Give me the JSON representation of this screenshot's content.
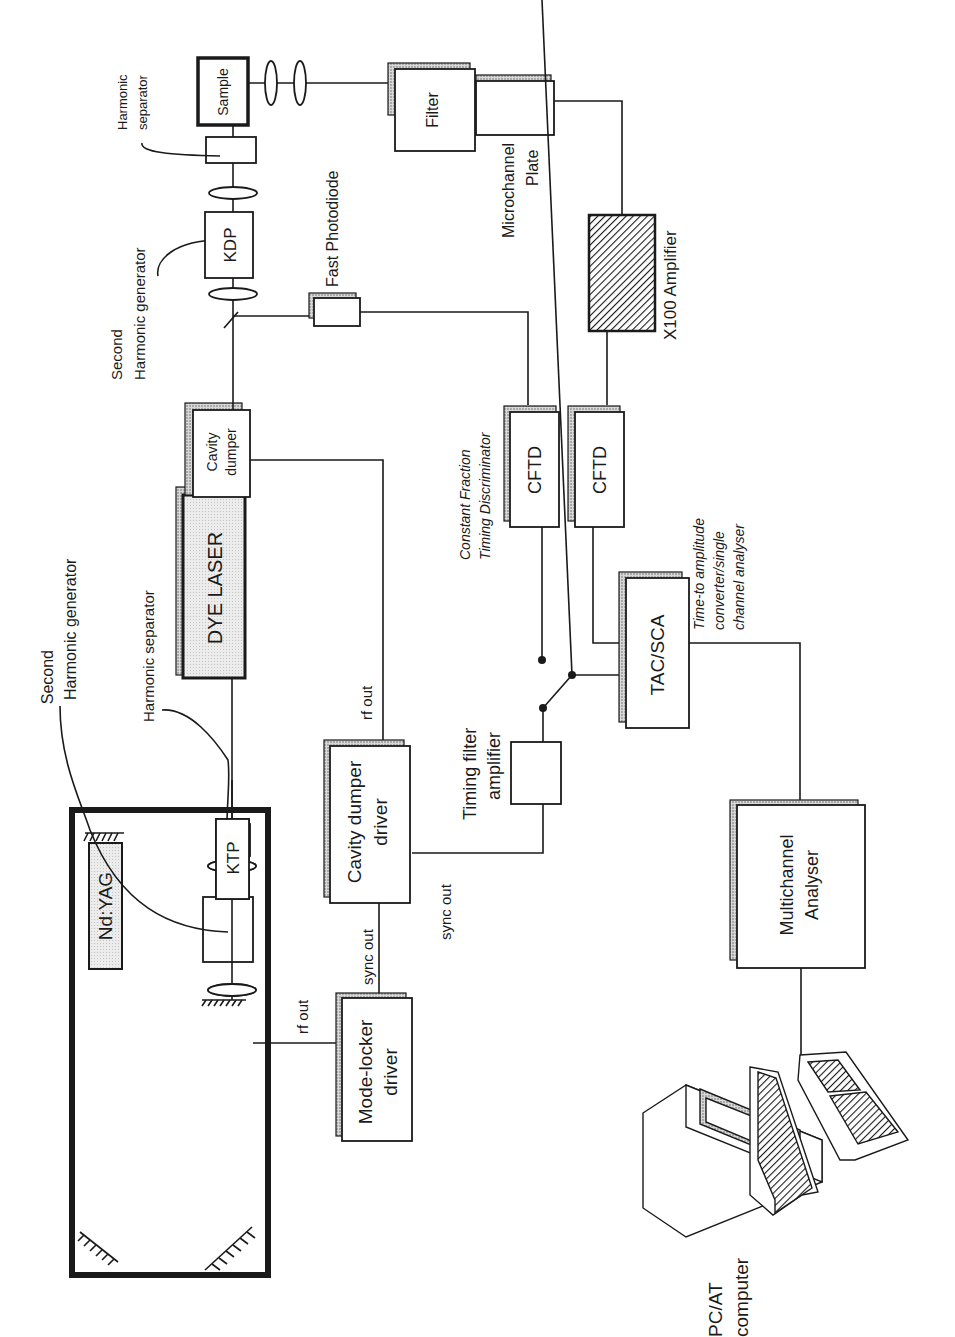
{
  "diagram": {
    "nd_yag": {
      "label": "Nd:YAG",
      "ktp_label": "KTP",
      "shg_label_line1": "Second",
      "shg_label_line2": "Harmonic generator",
      "separator_label": "Harmonic separator"
    },
    "dye_laser": {
      "label": "DYE LASER"
    },
    "cavity_dumper": {
      "line1": "Cavity",
      "line2": "dumper"
    },
    "second_shg": {
      "line1": "Second",
      "line2": "Harmonic generator",
      "crystal": "KDP"
    },
    "harmonic_separator_2": {
      "line1": "Harmonic",
      "line2": "separator"
    },
    "sample": {
      "label": "Sample"
    },
    "filter": {
      "label": "Filter"
    },
    "microchannel_plate": {
      "line1": "Microchannel",
      "line2": "Plate"
    },
    "amplifier": {
      "label": "X100 Amplifier"
    },
    "fast_photodiode": {
      "label": "Fast Photodiode"
    },
    "cftd": {
      "label_a": "CFTD",
      "label_b": "CFTD",
      "desc_line1": "Constant Fraction",
      "desc_line2": "Timing Discriminator"
    },
    "tac_sca": {
      "label": "TAC/SCA",
      "desc_line1": "Time-to amplitude",
      "desc_line2": "converter/single",
      "desc_line3": "channel analyser"
    },
    "timing_filter_amp": {
      "line1": "Timing filter",
      "line2": "amplifier"
    },
    "cavity_dumper_driver": {
      "line1": "Cavity dumper",
      "line2": "driver",
      "rf_out": "rf out",
      "sync_out": "sync out"
    },
    "mode_locker_driver": {
      "line1": "Mode-locker",
      "line2": "driver",
      "rf_out": "rf out",
      "sync_out": "sync out"
    },
    "multichannel_analyser": {
      "line1": "Multichannel",
      "line2": "Analyser"
    },
    "computer": {
      "line1": "PC/AT",
      "line2": "computer"
    }
  }
}
